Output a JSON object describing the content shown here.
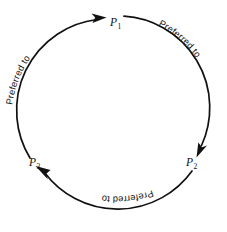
{
  "figure": {
    "background_color": "#ffffff",
    "stroke_color": "#111111",
    "width": 227,
    "height": 232
  },
  "nodes": [
    {
      "id": "p1",
      "base": "P",
      "subscript": "1",
      "label": "P1",
      "position": "top",
      "x": 113,
      "y": 22
    },
    {
      "id": "p2",
      "base": "P",
      "subscript": "2",
      "label": "P2",
      "position": "lower-right",
      "x": 190,
      "y": 162
    },
    {
      "id": "p3",
      "base": "P",
      "subscript": "3",
      "label": "P3",
      "position": "lower-left",
      "x": 33,
      "y": 162
    }
  ],
  "edges": [
    {
      "id": "edge-p3-p1",
      "from": "p3",
      "to": "p1",
      "label": "Preferred to",
      "side": "left",
      "arrow_at": "p1"
    },
    {
      "id": "edge-p1-p2",
      "from": "p1",
      "to": "p2",
      "label": "Preferred to",
      "side": "right",
      "arrow_at": "p2"
    },
    {
      "id": "edge-p2-p3",
      "from": "p2",
      "to": "p3",
      "label": "Preferred to",
      "side": "bottom",
      "arrow_at": "p3"
    }
  ],
  "edge_labels": {
    "left": "Preferred to",
    "right": "Preferred to",
    "bottom": "Preferred to"
  }
}
